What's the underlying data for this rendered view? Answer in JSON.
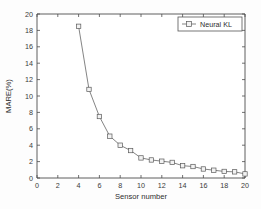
{
  "chart_data": {
    "type": "line",
    "title": "",
    "xlabel": "Sensor number",
    "ylabel": "MARE(%)",
    "xlim": [
      0,
      20
    ],
    "ylim": [
      0,
      20
    ],
    "xticks": [
      0,
      2,
      4,
      6,
      8,
      10,
      12,
      14,
      16,
      18,
      20
    ],
    "yticks": [
      0,
      2,
      4,
      6,
      8,
      10,
      12,
      14,
      16,
      18,
      20
    ],
    "xtick_labels": [
      "0",
      "2",
      "4",
      "6",
      "8",
      "10",
      "12",
      "14",
      "16",
      "18",
      "20"
    ],
    "ytick_labels": [
      "0",
      "2",
      "4",
      "6",
      "8",
      "10",
      "12",
      "14",
      "16",
      "18",
      "20"
    ],
    "grid": false,
    "legend_position": "top-right",
    "series": [
      {
        "name": "Neural KL",
        "marker": "square",
        "line_color": "#6e6e6e",
        "marker_color": "#5a5a5a",
        "x": [
          4,
          5,
          6,
          7,
          8,
          9,
          10,
          11,
          12,
          13,
          14,
          15,
          16,
          17,
          18,
          19,
          20
        ],
        "values": [
          18.5,
          10.8,
          7.5,
          5.1,
          4.0,
          3.35,
          2.45,
          2.2,
          2.05,
          1.9,
          1.5,
          1.4,
          1.1,
          0.95,
          0.8,
          0.75,
          0.5
        ]
      }
    ]
  },
  "legend": {
    "entries": [
      {
        "label": "Neural KL"
      }
    ]
  },
  "axes": {
    "x_label": "Sensor number",
    "y_label": "MARE(%)"
  }
}
